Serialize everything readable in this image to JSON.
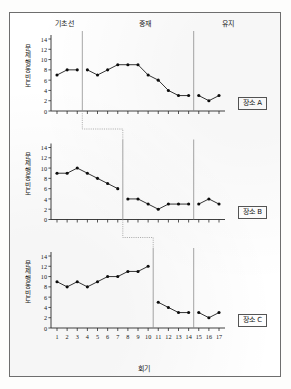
{
  "figure": {
    "xaxis_title": "회기",
    "phase_labels": [
      {
        "id": "baseline",
        "text": "기초선"
      },
      {
        "id": "intervention",
        "text": "중재"
      },
      {
        "id": "maintenance",
        "text": "유지"
      }
    ],
    "y_axis_title": "문제행동 빈도",
    "y_ticks": [
      "14",
      "12",
      "10",
      "8",
      "6",
      "4",
      "2",
      "0"
    ],
    "x_ticks": [
      "1",
      "2",
      "3",
      "4",
      "5",
      "6",
      "7",
      "8",
      "9",
      "10",
      "11",
      "12",
      "13",
      "14",
      "15",
      "16",
      "17"
    ],
    "legends": [
      "장소 A",
      "장소 B",
      "장소 C"
    ]
  },
  "chart_data": [
    {
      "type": "line",
      "title": "장소 A",
      "xlabel": "회기",
      "ylabel": "문제행동 빈도",
      "xlim": [
        1,
        17
      ],
      "ylim": [
        0,
        14
      ],
      "grid": false,
      "marker": "filled-diamond",
      "phase_lines": [
        3.5,
        14.5
      ],
      "phases": [
        {
          "name": "기초선",
          "sessions": [
            1,
            2,
            3
          ]
        },
        {
          "name": "중재",
          "sessions": [
            4,
            14
          ]
        },
        {
          "name": "유지",
          "sessions": [
            15,
            17
          ]
        }
      ],
      "series": [
        {
          "name": "기초선",
          "x": [
            1,
            2,
            3
          ],
          "values": [
            7,
            8,
            8
          ]
        },
        {
          "name": "중재",
          "x": [
            4,
            5,
            6,
            7,
            8,
            9,
            10,
            11,
            12,
            13,
            14
          ],
          "values": [
            8,
            7,
            8,
            9,
            9,
            9,
            7,
            6,
            4,
            3,
            3
          ]
        },
        {
          "name": "유지",
          "x": [
            15,
            16,
            17
          ],
          "values": [
            3,
            2,
            3
          ]
        }
      ]
    },
    {
      "type": "line",
      "title": "장소 B",
      "xlabel": "회기",
      "ylabel": "문제행동 빈도",
      "xlim": [
        1,
        17
      ],
      "ylim": [
        0,
        14
      ],
      "grid": false,
      "marker": "filled-diamond",
      "phase_lines": [
        7.5,
        14.5
      ],
      "phases": [
        {
          "name": "기초선",
          "sessions": [
            1,
            7
          ]
        },
        {
          "name": "중재",
          "sessions": [
            8,
            14
          ]
        },
        {
          "name": "유지",
          "sessions": [
            15,
            17
          ]
        }
      ],
      "series": [
        {
          "name": "기초선",
          "x": [
            1,
            2,
            3,
            4,
            5,
            6,
            7
          ],
          "values": [
            9,
            9,
            10,
            9,
            8,
            7,
            6
          ]
        },
        {
          "name": "중재",
          "x": [
            8,
            9,
            10,
            11,
            12,
            13,
            14
          ],
          "values": [
            4,
            4,
            3,
            2,
            3,
            3,
            3
          ]
        },
        {
          "name": "유지",
          "x": [
            15,
            16,
            17
          ],
          "values": [
            3,
            4,
            3
          ]
        }
      ]
    },
    {
      "type": "line",
      "title": "장소 C",
      "xlabel": "회기",
      "ylabel": "문제행동 빈도",
      "xlim": [
        1,
        17
      ],
      "ylim": [
        0,
        14
      ],
      "grid": false,
      "marker": "filled-diamond",
      "phase_lines": [
        10.5,
        14.5
      ],
      "phases": [
        {
          "name": "기초선",
          "sessions": [
            1,
            10
          ]
        },
        {
          "name": "중재",
          "sessions": [
            11,
            14
          ]
        },
        {
          "name": "유지",
          "sessions": [
            15,
            17
          ]
        }
      ],
      "series": [
        {
          "name": "기초선",
          "x": [
            1,
            2,
            3,
            4,
            5,
            6,
            7,
            8,
            9,
            10
          ],
          "values": [
            9,
            8,
            9,
            8,
            9,
            10,
            10,
            11,
            11,
            12
          ]
        },
        {
          "name": "중재",
          "x": [
            11,
            12,
            13,
            14
          ],
          "values": [
            5,
            4,
            3,
            3
          ]
        },
        {
          "name": "유지",
          "x": [
            15,
            16,
            17
          ],
          "values": [
            3,
            2,
            3
          ]
        }
      ]
    }
  ]
}
